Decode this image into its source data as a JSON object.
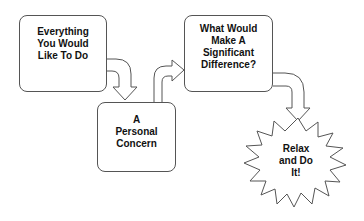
{
  "diagram": {
    "nodes": [
      {
        "id": "box1",
        "label": "Everything\nYou Would\nLike To Do",
        "shape": "rounded-rect"
      },
      {
        "id": "box2",
        "label": "A\nPersonal\nConcern",
        "shape": "rounded-rect"
      },
      {
        "id": "box3",
        "label": "What Would\nMake A\nSignificant\nDifference?",
        "shape": "rounded-rect"
      },
      {
        "id": "burst",
        "label": "Relax\nand Do\nIt!",
        "shape": "starburst"
      }
    ],
    "edges": [
      {
        "from": "box1",
        "to": "box2",
        "style": "block-arrow-curved-down"
      },
      {
        "from": "box2",
        "to": "box3",
        "style": "block-arrow-curved-up-right"
      },
      {
        "from": "box3",
        "to": "burst",
        "style": "block-arrow-curved-down"
      }
    ],
    "colors": {
      "stroke": "#555555",
      "fill": "#ffffff",
      "text": "#111111"
    }
  }
}
